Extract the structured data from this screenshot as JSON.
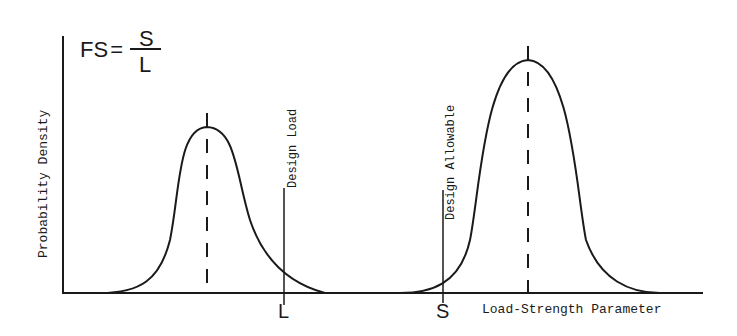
{
  "formula": {
    "lhs": "FS",
    "eq": "=",
    "numerator": "S",
    "denominator": "L"
  },
  "axes": {
    "ylabel": "Probability Density",
    "xlabel": "Load-Strength Parameter"
  },
  "markers": {
    "design_load": {
      "label": "Design Load",
      "tick": "L"
    },
    "design_allowable": {
      "label": "Design Allowable",
      "tick": "S"
    }
  },
  "curves": [
    {
      "name": "load-distribution",
      "mean_x": 207,
      "peak_y": 127
    },
    {
      "name": "strength-distribution",
      "mean_x": 528,
      "peak_y": 60
    }
  ],
  "colors": {
    "ink": "#1a1a1a",
    "background": "#ffffff"
  }
}
